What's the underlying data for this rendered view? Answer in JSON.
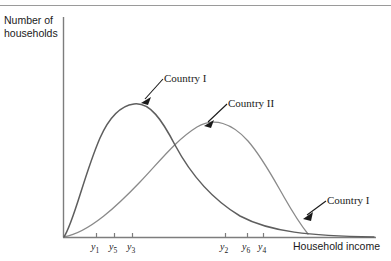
{
  "figure": {
    "background": "#ffffff",
    "rule_color": "#9a9a9a",
    "axis_color": "#7d7d7d",
    "curve_color": "#6e6e6e",
    "arrow_color": "#1a1a1a"
  },
  "chart_data": {
    "type": "line",
    "title": "",
    "subtitle": "",
    "xlabel": "Household income",
    "ylabel": "Number of households",
    "ylabel_lines": [
      "Number of",
      "households"
    ],
    "grid": false,
    "legend_position": "inline-annotations",
    "xlim": [
      0,
      100
    ],
    "ylim": [
      0,
      100
    ],
    "axis_ticks_labeled": false,
    "x_tick_labels": [
      "y1",
      "y5",
      "y3",
      "y2",
      "y6",
      "y4"
    ],
    "x_ticks": [
      {
        "label_base": "y",
        "label_sub": "1",
        "x_px": 96
      },
      {
        "label_base": "y",
        "label_sub": "5",
        "x_px": 114
      },
      {
        "label_base": "y",
        "label_sub": "3",
        "x_px": 132
      },
      {
        "label_base": "y",
        "label_sub": "2",
        "x_px": 225
      },
      {
        "label_base": "y",
        "label_sub": "6",
        "x_px": 247
      },
      {
        "label_base": "y",
        "label_sub": "4",
        "x_px": 263
      }
    ],
    "annotations": [
      {
        "text": "Country I",
        "target": "peak-of-country-1-curve"
      },
      {
        "text": "Country II",
        "target": "peak-of-country-2-curve"
      },
      {
        "text": "Country I",
        "target": "right-tail-of-country-1-curve"
      }
    ],
    "series": [
      {
        "name": "Country I",
        "description": "Income distribution density with an earlier, higher mode and a fatter right tail",
        "peak_x_px": 132,
        "peak_y_px": 104,
        "x": [
          0,
          5,
          10,
          15,
          20,
          25,
          30,
          35,
          40,
          45,
          50,
          55,
          60,
          65,
          70,
          75,
          80,
          85,
          90,
          95,
          100
        ],
        "values": [
          0,
          21,
          44,
          63,
          78,
          88,
          94,
          96,
          95,
          90,
          83,
          74,
          64,
          54,
          45,
          37,
          29,
          23,
          18,
          14,
          10
        ]
      },
      {
        "name": "Country II",
        "description": "Income distribution density with a later, lower mode and a thinner right tail",
        "peak_x_px": 197,
        "peak_y_px": 122,
        "x": [
          0,
          5,
          10,
          15,
          20,
          25,
          30,
          35,
          40,
          45,
          50,
          55,
          60,
          65,
          70,
          75,
          80,
          85,
          90,
          95,
          100
        ],
        "values": [
          0,
          7,
          15,
          23,
          32,
          41,
          50,
          58,
          66,
          72,
          76,
          78,
          77,
          73,
          66,
          57,
          47,
          36,
          25,
          14,
          4
        ]
      }
    ]
  },
  "labels": {
    "y_axis": "Number of households",
    "y_axis_line1": "Number of",
    "y_axis_line2": "households",
    "x_axis": "Household income",
    "country_one_top": "Country I",
    "country_two": "Country II",
    "country_one_bottom": "Country I"
  }
}
